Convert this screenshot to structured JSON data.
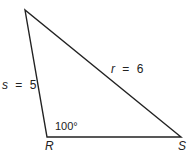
{
  "diagram": {
    "type": "triangle",
    "stroke_color": "#222222",
    "background": "#ffffff",
    "vertices": {
      "top": {
        "x": 25,
        "y": 10,
        "label": ""
      },
      "R": {
        "x": 47,
        "y": 137,
        "label": "R"
      },
      "S": {
        "x": 181,
        "y": 137,
        "label": "S"
      }
    },
    "sides": {
      "s": {
        "name": "s",
        "eq": "=",
        "value": "5",
        "text": "s = 5"
      },
      "r": {
        "name": "r",
        "eq": "=",
        "value": "6",
        "text": "r = 6"
      }
    },
    "angle": {
      "at": "R",
      "text": "100°"
    }
  }
}
